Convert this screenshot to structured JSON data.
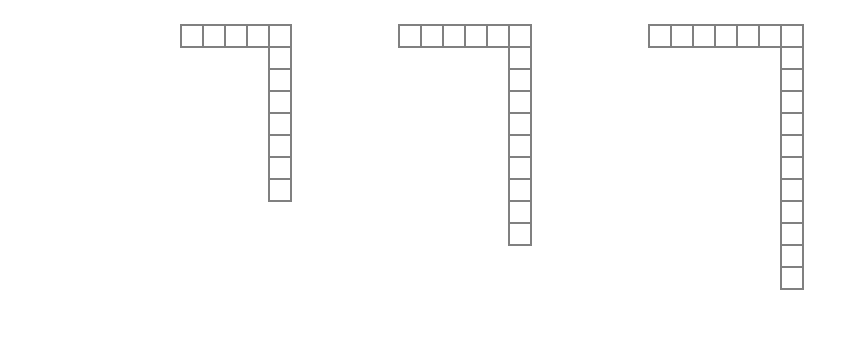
{
  "diagram": {
    "title": "",
    "cell_size_px": 24,
    "border_color": "#808080",
    "figures": [
      {
        "id": 1,
        "x": 180,
        "y": 24,
        "top_row_cells": 5,
        "column_cells_below_corner": 7,
        "total_cells": 12
      },
      {
        "id": 2,
        "x": 398,
        "y": 24,
        "top_row_cells": 6,
        "column_cells_below_corner": 9,
        "total_cells": 15
      },
      {
        "id": 3,
        "x": 648,
        "y": 24,
        "top_row_cells": 7,
        "column_cells_below_corner": 11,
        "total_cells": 18
      }
    ]
  }
}
